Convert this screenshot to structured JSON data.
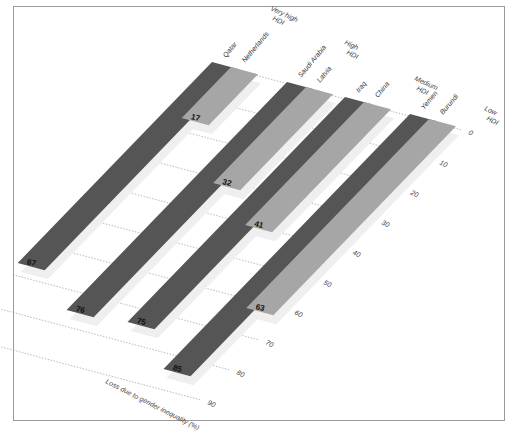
{
  "chart_data": {
    "type": "bar",
    "title": "",
    "xlabel": "",
    "ylabel": "Loss due to gender inequality (%)",
    "ylim": [
      0,
      90
    ],
    "ticks": [
      0,
      10,
      20,
      30,
      40,
      50,
      60,
      70,
      80,
      90
    ],
    "grid": true,
    "categories": [
      "Qatar",
      "Netherlands",
      "Saudi Arabia",
      "Latvia",
      "Iraq",
      "China",
      "Yemen",
      "Burundi"
    ],
    "values": [
      67,
      17,
      76,
      32,
      75,
      41,
      85,
      63
    ],
    "groups": [
      {
        "name": "Very high HDI",
        "line1": "Very high",
        "line2": "HDI",
        "countries": [
          "Qatar",
          "Netherlands"
        ],
        "values": [
          67,
          17
        ]
      },
      {
        "name": "High HDI",
        "line1": "High",
        "line2": "HDI",
        "countries": [
          "Saudi Arabia",
          "Latvia"
        ],
        "values": [
          76,
          32
        ]
      },
      {
        "name": "Medium HDI",
        "line1": "Medium",
        "line2": "HDI",
        "countries": [
          "Iraq",
          "China"
        ],
        "values": [
          75,
          41
        ]
      },
      {
        "name": "Low HDI",
        "line1": "Low",
        "line2": "HDI",
        "countries": [
          "Yemen",
          "Burundi"
        ],
        "values": [
          85,
          63
        ]
      }
    ],
    "colors": {
      "worst": "#555555",
      "best": "#a6a6a6",
      "shadow": "#efefef",
      "grid": "#8c8c8c"
    }
  }
}
